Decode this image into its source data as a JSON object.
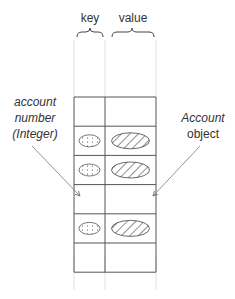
{
  "diagram": {
    "column_labels": {
      "key": "key",
      "value": "value"
    },
    "left_annotation": [
      "account",
      "number",
      "(Integer)"
    ],
    "right_annotation": [
      "Account",
      "object"
    ],
    "rows": [
      {
        "filled": false
      },
      {
        "filled": true
      },
      {
        "filled": true
      },
      {
        "filled": false
      },
      {
        "filled": true
      },
      {
        "filled": false
      }
    ],
    "colors": {
      "line": "#555555",
      "faint": "#dddddd",
      "text": "#333333"
    }
  }
}
